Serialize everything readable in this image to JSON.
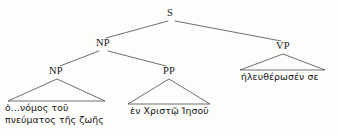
{
  "figure": {
    "type": "syntax-tree",
    "background_color": "#fdfdfc",
    "line_color": "#555555",
    "text_color": "#141414"
  },
  "nodes": {
    "s": {
      "label": "S",
      "x": 170,
      "y": 14
    },
    "np_upper": {
      "label": "NP",
      "x": 103,
      "y": 44
    },
    "vp": {
      "label": "VP",
      "x": 283,
      "y": 47
    },
    "np_lower": {
      "label": "NP",
      "x": 56,
      "y": 72
    },
    "pp": {
      "label": "PP",
      "x": 169,
      "y": 72
    }
  },
  "leaves": {
    "np_lower_text": {
      "line1": "ὁ...νόμος τοῦ",
      "line2": "πνεύματος τῆς ζωῆς",
      "x": 5,
      "y": 103
    },
    "pp_text": {
      "line1": "ἐν Χριστῷ  Ἰησοῦ",
      "x": 130,
      "y": 106
    },
    "vp_text": {
      "line1": "ἠλευθέρωσέν σε",
      "x": 241,
      "y": 72
    }
  },
  "branches": [
    {
      "name": "s-to-np",
      "x1": 168,
      "y1": 21,
      "x2": 106,
      "y2": 38
    },
    {
      "name": "s-to-vp",
      "x1": 175,
      "y1": 21,
      "x2": 281,
      "y2": 41
    },
    {
      "name": "np-to-np",
      "x1": 99,
      "y1": 51,
      "x2": 60,
      "y2": 66
    },
    {
      "name": "np-to-pp",
      "x1": 108,
      "y1": 51,
      "x2": 166,
      "y2": 66
    }
  ],
  "triangles": [
    {
      "name": "np-lower-triangle",
      "apex_x": 57,
      "apex_y": 79,
      "left_x": 8,
      "right_x": 105,
      "base_y": 101
    },
    {
      "name": "pp-triangle",
      "apex_x": 169,
      "apex_y": 79,
      "left_x": 128,
      "right_x": 210,
      "base_y": 104
    },
    {
      "name": "vp-triangle",
      "apex_x": 283,
      "apex_y": 54,
      "left_x": 240,
      "right_x": 325,
      "base_y": 70
    }
  ]
}
